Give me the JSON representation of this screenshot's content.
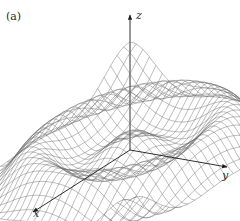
{
  "figure": {
    "panel_label": "(a)",
    "axes": {
      "x_label": "x",
      "y_label": "y",
      "z_label": "z"
    },
    "surface": {
      "description": "Radially symmetric rippled wireframe surface (damped cosine of distance from origin)",
      "style": "wireframe",
      "line_color": "#6b6b6b",
      "grid_lines": 30,
      "domain_half_width": 1.0,
      "ripple_frequency": 9.0,
      "amplitude": 0.14
    },
    "colors": {
      "axis": "#1a1a1a",
      "text": "#2a2a2a",
      "background": "#ffffff"
    }
  }
}
